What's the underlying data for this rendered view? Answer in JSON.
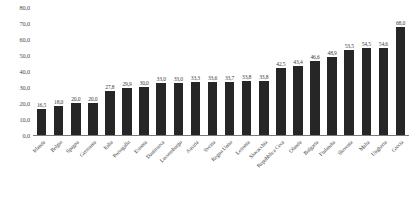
{
  "chart_data": {
    "type": "bar",
    "title": "",
    "subtitle": "",
    "xlabel": "",
    "ylabel": "",
    "ylim": [
      0.0,
      80.0
    ],
    "y_ticks": [
      "0,0",
      "10,0",
      "20,0",
      "30,0",
      "40,0",
      "50,0",
      "60,0",
      "70,0",
      "80,0"
    ],
    "y_tick_values": [
      0.0,
      10.0,
      20.0,
      30.0,
      40.0,
      50.0,
      60.0,
      70.0,
      80.0
    ],
    "grid": false,
    "legend": false,
    "legend_position": "none",
    "decimal_separator": ",",
    "bar_color": "#262626",
    "axis_color": "#7a7a7a",
    "categories": [
      "Irlanda",
      "Belgio",
      "Spagna",
      "Germania",
      "Italia",
      "Portogallo",
      "Estonia",
      "Danimarca",
      "Lussemburgo",
      "Austria",
      "Svezia",
      "Regno Unito",
      "Lettonia",
      "Slovacchia",
      "Repubblica Ceca",
      "Olanda",
      "Bulgaria",
      "Finlandia",
      "Slovenia",
      "Malta",
      "Ungheria",
      "Grecia"
    ],
    "values": [
      16.5,
      18.0,
      20.0,
      20.0,
      27.8,
      29.9,
      30.0,
      33.0,
      33.0,
      33.3,
      33.6,
      33.7,
      33.8,
      33.8,
      42.5,
      43.4,
      46.6,
      48.9,
      53.5,
      54.5,
      54.6,
      68.0
    ],
    "data_labels": [
      "16,5",
      "18,0",
      "20,0",
      "20,0",
      "27,8",
      "29,9",
      "30,0",
      "33,0",
      "33,0",
      "33,3",
      "33,6",
      "33,7",
      "33,8",
      "33,8",
      "42,5",
      "43,4",
      "46,6",
      "48,9",
      "53,5",
      "54,5",
      "54,6",
      "68,0"
    ]
  }
}
